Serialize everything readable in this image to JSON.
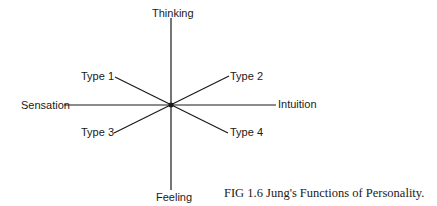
{
  "diagram": {
    "axes": {
      "top": "Thinking",
      "bottom": "Feeling",
      "left": "Sensation",
      "right": "Intuition"
    },
    "types": [
      "Type 1",
      "Type 2",
      "Type 3",
      "Type 4"
    ],
    "caption": "FIG 1.6   Jung's Functions of Personality.",
    "line_color": "#1a1a1a"
  }
}
